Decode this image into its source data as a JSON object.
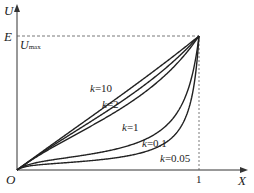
{
  "chart_data": {
    "type": "line",
    "title": "",
    "xlabel": "X",
    "ylabel": "U",
    "origin_label": "O",
    "x_ticks": [
      "1"
    ],
    "y_ticks": [
      "E",
      "U_max"
    ],
    "y_tick_main": "E",
    "y_tick_sub_main": "U",
    "y_tick_sub": "max",
    "xlim": [
      0,
      1
    ],
    "ylim": [
      0,
      1
    ],
    "grid": false,
    "legend": "inline labels",
    "formula_hint": "U/E = kX / (k + X(1 - X))",
    "series": [
      {
        "name": "k=10",
        "k": 10,
        "label_k": "k",
        "label_val": "=10"
      },
      {
        "name": "k=2",
        "k": 2,
        "label_k": "k",
        "label_val": "=2"
      },
      {
        "name": "k=1",
        "k": 1,
        "label_k": "k",
        "label_val": "=1"
      },
      {
        "name": "k=0.1",
        "k": 0.1,
        "label_k": "k",
        "label_val": "=0.1"
      },
      {
        "name": "k=0.05",
        "k": 0.05,
        "label_k": "k",
        "label_val": "=0.05"
      }
    ],
    "x": [
      0,
      0.1,
      0.2,
      0.3,
      0.4,
      0.5,
      0.6,
      0.7,
      0.8,
      0.9,
      1.0
    ],
    "values": {
      "k=10": [
        0,
        0.099,
        0.197,
        0.294,
        0.391,
        0.488,
        0.586,
        0.685,
        0.787,
        0.891,
        1
      ],
      "k=2": [
        0,
        0.096,
        0.185,
        0.271,
        0.357,
        0.444,
        0.536,
        0.635,
        0.741,
        0.863,
        1
      ],
      "k=1": [
        0,
        0.092,
        0.172,
        0.248,
        0.323,
        0.4,
        0.484,
        0.579,
        0.69,
        0.826,
        1
      ],
      "k=0.1": [
        0,
        0.053,
        0.077,
        0.088,
        0.098,
        0.114,
        0.14,
        0.189,
        0.294,
        0.526,
        1
      ],
      "k=0.05": [
        0,
        0.053,
        0.046,
        0.048,
        0.05,
        0.059,
        0.072,
        0.104,
        0.172,
        0.357,
        1
      ]
    }
  }
}
